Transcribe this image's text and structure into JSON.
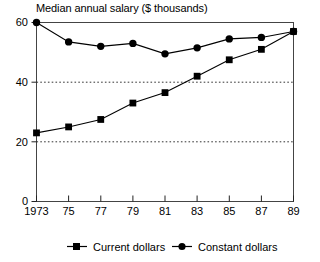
{
  "chart_data": {
    "type": "line",
    "title": "Median annual salary ($ thousands)",
    "xlabel": "",
    "ylabel": "",
    "x": [
      1973,
      1975,
      1977,
      1979,
      1981,
      1983,
      1985,
      1987,
      1989
    ],
    "categories": [
      "1973",
      "75",
      "77",
      "79",
      "81",
      "83",
      "85",
      "87",
      "89"
    ],
    "series": [
      {
        "name": "Current dollars",
        "marker": "square",
        "values": [
          23,
          25,
          27.5,
          33,
          36.5,
          42,
          47.5,
          51,
          57
        ]
      },
      {
        "name": "Constant dollars",
        "marker": "circle",
        "values": [
          60,
          53.5,
          52,
          53,
          49.5,
          51.5,
          54.5,
          55,
          57
        ]
      }
    ],
    "ylim": [
      0,
      60
    ],
    "yticks": [
      0,
      20,
      40,
      60
    ],
    "ytick_labels": [
      "0",
      "20",
      "40",
      "60"
    ],
    "gridlines": [
      20,
      40
    ],
    "grid": "horizontal-dotted",
    "legend_position": "bottom-center",
    "frame": "box",
    "line_color": "#000000",
    "marker_color": "#000000",
    "grid_color": "#555555",
    "background": "#ffffff"
  },
  "axes": {
    "y_ticks": [
      {
        "label": "60",
        "value": 60
      },
      {
        "label": "40",
        "value": 40
      },
      {
        "label": "20",
        "value": 20
      },
      {
        "label": "0",
        "value": 0
      }
    ],
    "x_ticks": [
      {
        "label": "1973",
        "value": 1973
      },
      {
        "label": "75",
        "value": 1975
      },
      {
        "label": "77",
        "value": 1977
      },
      {
        "label": "79",
        "value": 1979
      },
      {
        "label": "81",
        "value": 1981
      },
      {
        "label": "83",
        "value": 1983
      },
      {
        "label": "85",
        "value": 1985
      },
      {
        "label": "87",
        "value": 1987
      },
      {
        "label": "89",
        "value": 1989
      }
    ]
  },
  "legend": {
    "entries": [
      {
        "label": "Current dollars",
        "marker": "square"
      },
      {
        "label": "Constant dollars",
        "marker": "circle"
      }
    ]
  }
}
